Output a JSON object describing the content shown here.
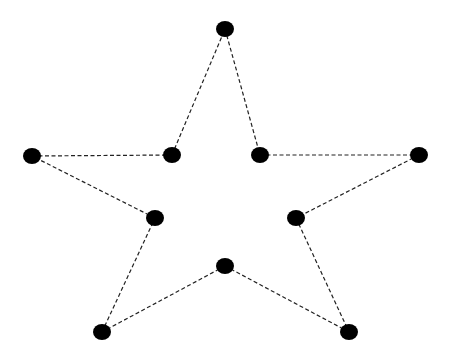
{
  "diagram": {
    "title": "",
    "shape": "five-pointed star",
    "background": "#ffffff",
    "dot_color": "#000000",
    "line_color": "#222222",
    "line_style": "dashed",
    "dot_rx": 9,
    "dot_ry": 8,
    "points": [
      {
        "id": "top",
        "x": 225,
        "y": 29
      },
      {
        "id": "inner-upper-right",
        "x": 260,
        "y": 155
      },
      {
        "id": "outer-right",
        "x": 419,
        "y": 155
      },
      {
        "id": "inner-lower-right",
        "x": 296,
        "y": 218
      },
      {
        "id": "outer-bottom-right",
        "x": 349,
        "y": 332
      },
      {
        "id": "inner-bottom",
        "x": 225,
        "y": 266
      },
      {
        "id": "outer-bottom-left",
        "x": 102,
        "y": 332
      },
      {
        "id": "inner-lower-left",
        "x": 155,
        "y": 218
      },
      {
        "id": "outer-left",
        "x": 32,
        "y": 156
      },
      {
        "id": "inner-upper-left",
        "x": 172,
        "y": 155
      }
    ]
  }
}
